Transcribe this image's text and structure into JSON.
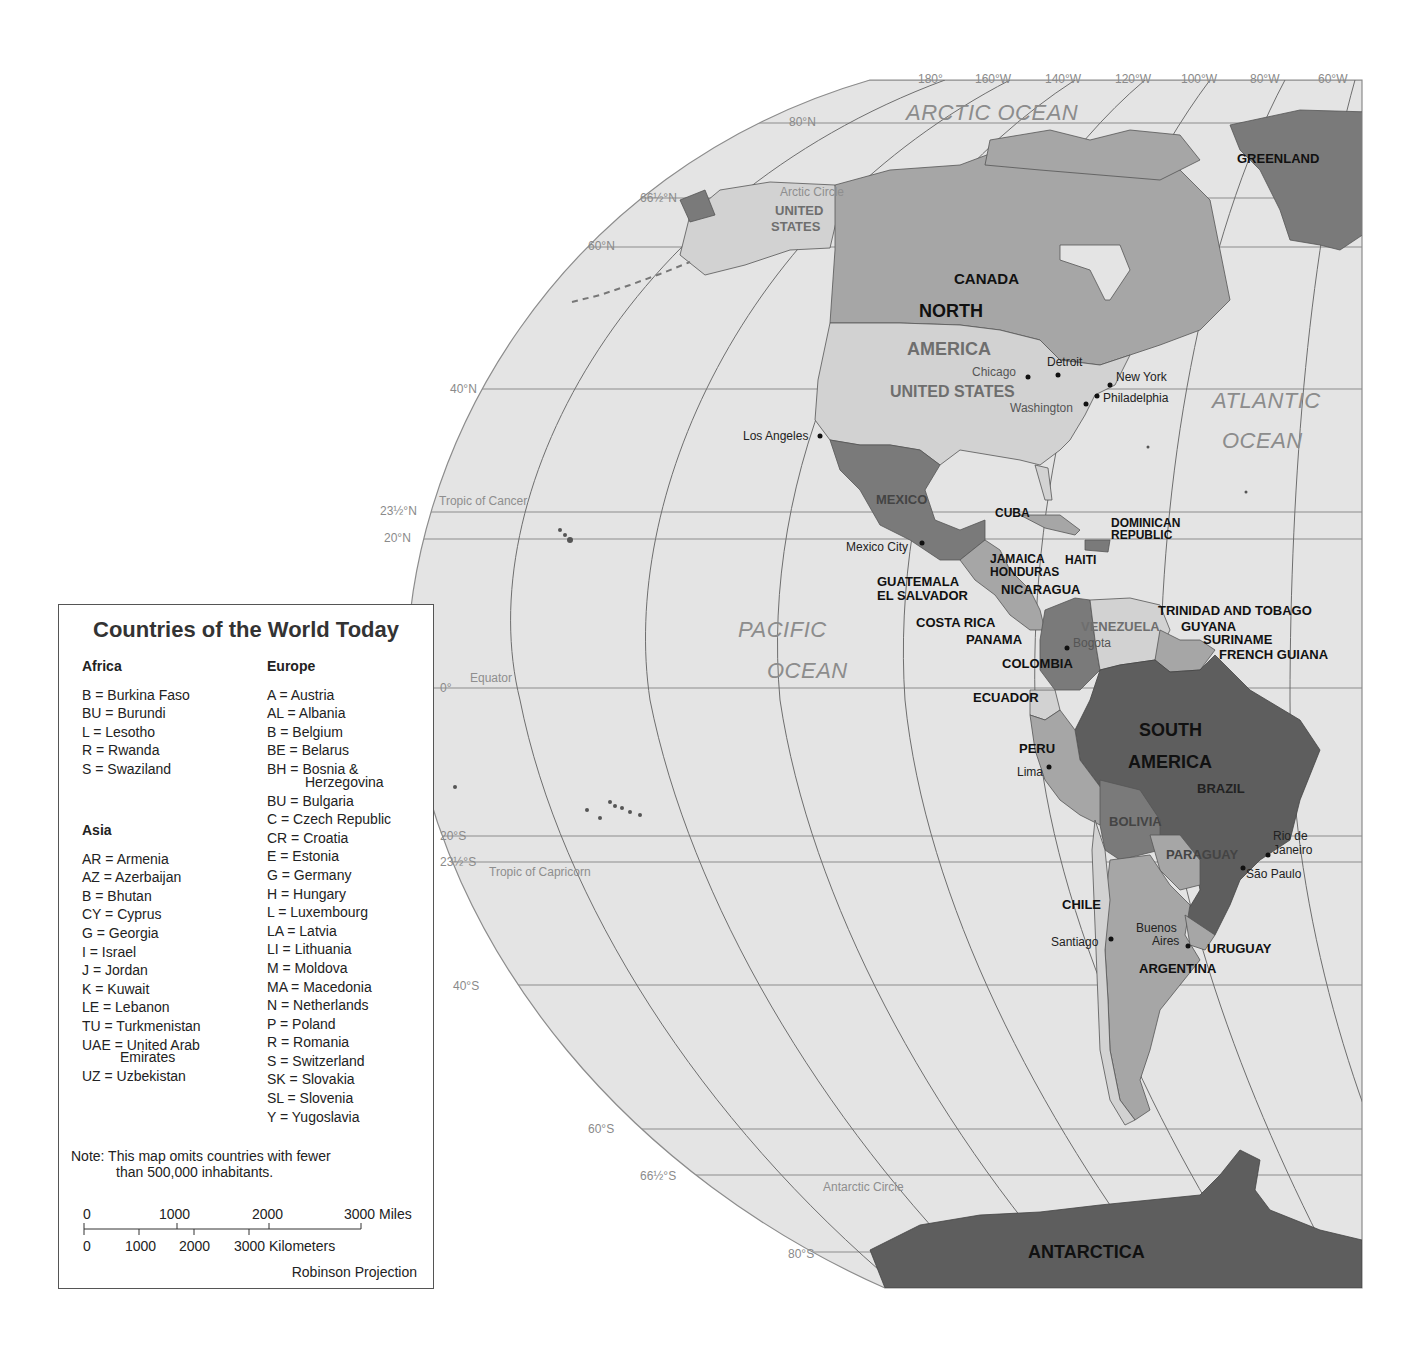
{
  "legend": {
    "title": "Countries of the World Today",
    "africa": {
      "heading": "Africa",
      "items": [
        "B = Burkina  Faso",
        "BU = Burundi",
        "L = Lesotho",
        "R = Rwanda",
        "S = Swaziland"
      ]
    },
    "asia": {
      "heading": "Asia",
      "items": [
        "AR = Armenia",
        "AZ = Azerbaijan",
        "B = Bhutan",
        "CY = Cyprus",
        "G = Georgia",
        "I = Israel",
        "J = Jordan",
        "K = Kuwait",
        "LE = Lebanon",
        "TU = Turkmenistan",
        "UAE = United Arab",
        "Emirates",
        "UZ = Uzbekistan"
      ]
    },
    "europe": {
      "heading": "Europe",
      "items": [
        "A = Austria",
        "AL = Albania",
        "B = Belgium",
        "BE = Belarus",
        "BH = Bosnia &",
        "Herzegovina",
        "BU = Bulgaria",
        "C = Czech Republic",
        "CR = Croatia",
        "E = Estonia",
        "G = Germany",
        "H = Hungary",
        "L = Luxembourg",
        "LA = Latvia",
        "LI = Lithuania",
        "M = Moldova",
        "MA = Macedonia",
        "N = Netherlands",
        "P = Poland",
        "R = Romania",
        "S = Switzerland",
        "SK = Slovakia",
        "SL = Slovenia",
        "Y = Yugoslavia"
      ]
    },
    "note_line1": "Note: This map omits countries with fewer",
    "note_line2": "than 500,000 inhabitants.",
    "scale": {
      "miles": [
        "0",
        "1000",
        "2000",
        "3000 Miles"
      ],
      "kilometers": [
        "0",
        "1000",
        "2000",
        "3000 Kilometers"
      ]
    },
    "projection": "Robinson Projection"
  },
  "graticule": {
    "longitudes": [
      "180°",
      "160°W",
      "140°W",
      "120°W",
      "100°W",
      "80°W",
      "60°W"
    ],
    "latitudes": [
      "80°N",
      "66½°N",
      "60°N",
      "40°N",
      "23½°N",
      "20°N",
      "0°",
      "20°S",
      "23½°S",
      "40°S",
      "60°S",
      "66½°S",
      "80°S"
    ],
    "special_lines": {
      "arctic_circle": "Arctic Circle",
      "tropic_cancer": "Tropic of Cancer",
      "equator": "Equator",
      "tropic_capricorn": "Tropic of Capricorn",
      "antarctic_circle": "Antarctic Circle"
    }
  },
  "oceans": {
    "arctic": "ARCTIC   OCEAN",
    "pacific_1": "PACIFIC",
    "pacific_2": "OCEAN",
    "atlantic_1": "ATLANTIC",
    "atlantic_2": "OCEAN"
  },
  "continents": {
    "north_1": "NORTH",
    "north_2": "AMERICA",
    "south_1": "SOUTH",
    "south_2": "AMERICA"
  },
  "countries": {
    "greenland": "GREENLAND",
    "canada": "CANADA",
    "us_alaska_1": "UNITED",
    "us_alaska_2": "STATES",
    "us": "UNITED STATES",
    "mexico": "MEXICO",
    "cuba": "CUBA",
    "dominican_1": "DOMINICAN",
    "dominican_2": "REPUBLIC",
    "haiti": "HAITI",
    "jamaica": "JAMAICA",
    "honduras": "HONDURAS",
    "guatemala": "GUATEMALA",
    "el_salvador": "EL SALVADOR",
    "nicaragua": "NICARAGUA",
    "costa_rica": "COSTA RICA",
    "panama": "PANAMA",
    "trinidad": "TRINIDAD AND TOBAGO",
    "venezuela": "VENEZUELA",
    "guyana": "GUYANA",
    "suriname": "SURINAME",
    "french_guiana": "FRENCH GUIANA",
    "colombia": "COLOMBIA",
    "ecuador": "ECUADOR",
    "peru": "PERU",
    "brazil": "BRAZIL",
    "bolivia": "BOLIVIA",
    "paraguay": "PARAGUAY",
    "chile": "CHILE",
    "uruguay": "URUGUAY",
    "argentina": "ARGENTINA",
    "antarctica": "ANTARCTICA"
  },
  "cities": {
    "chicago": "Chicago",
    "detroit": "Detroit",
    "new_york": "New York",
    "philadelphia": "Philadelphia",
    "washington": "Washington",
    "los_angeles": "Los Angeles",
    "mexico_city": "Mexico City",
    "bogota": "Bogota",
    "lima": "Lima",
    "rio_1": "Rio de",
    "rio_2": "Janeiro",
    "sao_paulo": "São Paulo",
    "santiago": "Santiago",
    "buenos_1": "Buenos",
    "buenos_2": "Aires"
  },
  "colors": {
    "ocean": "#e4e4e4",
    "land_light": "#d2d2d2",
    "land_mid": "#a6a6a6",
    "land_dark": "#7a7a7a",
    "land_darkest": "#5e5e5e",
    "grid": "#8c8c8c"
  }
}
